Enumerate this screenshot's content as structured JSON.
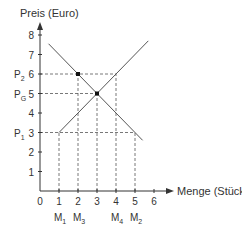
{
  "chart_data": {
    "type": "line",
    "title": "",
    "xlabel": "Menge (Stück)",
    "ylabel": "Preis (Euro)",
    "xlim": [
      0,
      6
    ],
    "ylim": [
      0,
      8
    ],
    "x_ticks": [
      "0",
      "1",
      "2",
      "3",
      "4",
      "5",
      "6"
    ],
    "y_ticks": [
      "1",
      "2",
      "3",
      "4",
      "5",
      "6",
      "7",
      "8"
    ],
    "grid": false,
    "series": [
      {
        "name": "Nachfrage",
        "x": [
          0.45,
          5.4
        ],
        "y": [
          7.55,
          2.6
        ]
      },
      {
        "name": "Angebot",
        "x": [
          1,
          5.7
        ],
        "y": [
          3,
          7.7
        ]
      }
    ],
    "points": [
      {
        "label": "",
        "x": 2,
        "y": 6
      },
      {
        "label": "Gleichgewicht",
        "x": 3,
        "y": 5
      }
    ],
    "price_labels": [
      {
        "main": "P",
        "sub": "2",
        "y": 6
      },
      {
        "main": "P",
        "sub": "G",
        "y": 5
      },
      {
        "main": "P",
        "sub": "1",
        "y": 3
      }
    ],
    "quantity_labels": [
      {
        "main": "M",
        "sub": "1",
        "x": 1
      },
      {
        "main": "M",
        "sub": "3",
        "x": 2
      },
      {
        "main": "M",
        "sub": "4",
        "x": 4
      },
      {
        "main": "M",
        "sub": "2",
        "x": 5
      }
    ],
    "dashed_guides": [
      {
        "from": [
          0,
          6
        ],
        "to": [
          4,
          6
        ]
      },
      {
        "from": [
          0,
          5
        ],
        "to": [
          3,
          5
        ]
      },
      {
        "from": [
          0,
          3
        ],
        "to": [
          5,
          3
        ]
      },
      {
        "from": [
          1,
          0
        ],
        "to": [
          1,
          3
        ]
      },
      {
        "from": [
          2,
          0
        ],
        "to": [
          2,
          6
        ]
      },
      {
        "from": [
          3,
          0
        ],
        "to": [
          3,
          5
        ]
      },
      {
        "from": [
          4,
          0
        ],
        "to": [
          4,
          6
        ]
      },
      {
        "from": [
          5,
          0
        ],
        "to": [
          5,
          3
        ]
      }
    ]
  }
}
